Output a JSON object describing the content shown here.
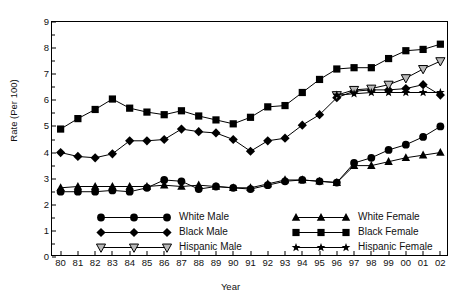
{
  "chart_data": {
    "type": "line",
    "title": "",
    "xlabel": "Year",
    "ylabel": "Rate (Per 100)",
    "ylim": [
      0,
      9
    ],
    "yticks": [
      0,
      1,
      2,
      3,
      4,
      5,
      6,
      7,
      8,
      9
    ],
    "grid": false,
    "legend_position": "bottom-inside",
    "categories": [
      "80",
      "81",
      "82",
      "83",
      "84",
      "85",
      "86",
      "87",
      "88",
      "89",
      "90",
      "91",
      "92",
      "93",
      "94",
      "95",
      "96",
      "97",
      "98",
      "99",
      "00",
      "01",
      "02"
    ],
    "series": [
      {
        "name": "White Male",
        "marker": "circle-filled",
        "color": "#000000",
        "values": [
          2.5,
          2.5,
          2.5,
          2.55,
          2.5,
          2.65,
          2.95,
          2.9,
          2.6,
          2.7,
          2.65,
          2.6,
          2.75,
          2.9,
          2.95,
          2.9,
          2.85,
          3.6,
          3.8,
          4.1,
          4.3,
          4.6,
          5.0
        ]
      },
      {
        "name": "Black Male",
        "marker": "diamond-filled",
        "color": "#000000",
        "values": [
          4.0,
          3.85,
          3.8,
          3.95,
          4.45,
          4.45,
          4.5,
          4.9,
          4.8,
          4.75,
          4.5,
          4.05,
          4.45,
          4.55,
          5.05,
          5.45,
          6.1,
          6.35,
          6.4,
          6.4,
          6.45,
          6.6,
          6.2
        ]
      },
      {
        "name": "Hispanic Male",
        "marker": "triangle-down-open",
        "color": "#9a9a9a",
        "start_index": 16,
        "values": [
          null,
          null,
          null,
          null,
          null,
          null,
          null,
          null,
          null,
          null,
          null,
          null,
          null,
          null,
          null,
          null,
          6.2,
          6.4,
          6.45,
          6.6,
          6.85,
          7.2,
          7.5
        ]
      },
      {
        "name": "White Female",
        "marker": "triangle-up-filled",
        "color": "#000000",
        "values": [
          2.65,
          2.7,
          2.7,
          2.7,
          2.7,
          2.7,
          2.75,
          2.7,
          2.75,
          2.7,
          2.65,
          2.65,
          2.8,
          2.95,
          2.95,
          2.9,
          2.85,
          3.5,
          3.5,
          3.65,
          3.8,
          3.9,
          4.0
        ]
      },
      {
        "name": "Black Female",
        "marker": "square-filled",
        "color": "#000000",
        "values": [
          4.9,
          5.3,
          5.65,
          6.05,
          5.7,
          5.55,
          5.45,
          5.6,
          5.4,
          5.25,
          5.1,
          5.35,
          5.75,
          5.8,
          6.3,
          6.8,
          7.2,
          7.25,
          7.25,
          7.6,
          7.9,
          7.95,
          8.15
        ]
      },
      {
        "name": "Hispanic Female",
        "marker": "star-filled",
        "color": "#000000",
        "start_index": 16,
        "values": [
          null,
          null,
          null,
          null,
          null,
          null,
          null,
          null,
          null,
          null,
          null,
          null,
          null,
          null,
          null,
          null,
          6.2,
          6.25,
          6.3,
          6.3,
          6.3,
          6.3,
          6.3
        ]
      }
    ]
  },
  "axes": {
    "y_label": "Rate (Per 100)",
    "x_label": "Year",
    "y_tick_labels": [
      "0",
      "1",
      "2",
      "3",
      "4",
      "5",
      "6",
      "7",
      "8",
      "9"
    ],
    "x_tick_labels": [
      "80",
      "81",
      "82",
      "83",
      "84",
      "85",
      "86",
      "87",
      "88",
      "89",
      "90",
      "91",
      "92",
      "93",
      "94",
      "95",
      "96",
      "97",
      "98",
      "99",
      "00",
      "01",
      "02"
    ]
  },
  "legend": {
    "column_left": [
      {
        "label": "White Male",
        "marker": "circle-filled"
      },
      {
        "label": "Black Male",
        "marker": "diamond-filled"
      },
      {
        "label": "Hispanic Male",
        "marker": "triangle-down-open"
      }
    ],
    "column_right": [
      {
        "label": "White Female",
        "marker": "triangle-up-filled"
      },
      {
        "label": "Black Female",
        "marker": "square-filled"
      },
      {
        "label": "Hispanic Female",
        "marker": "star-filled"
      }
    ]
  },
  "colors": {
    "line": "#000000",
    "hispanic_male_marker": "#9a9a9a",
    "axis": "#000000",
    "background": "#ffffff"
  }
}
